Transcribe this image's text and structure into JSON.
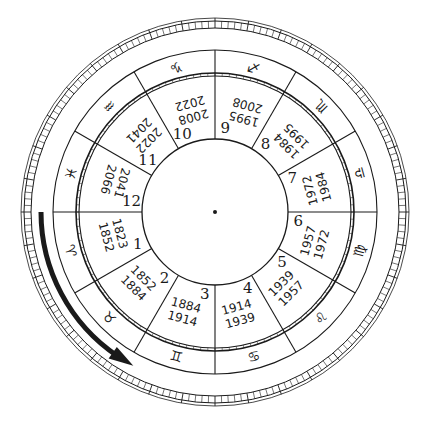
{
  "colors": {
    "ink": "#1a1a1a",
    "background": "#ffffff"
  },
  "center": {
    "x": 215,
    "y": 212
  },
  "radii": {
    "inner_circle": 73,
    "house_ring_inner": 136,
    "house_ring_outer": 139,
    "sign_ring_outer": 162,
    "arrow": 174,
    "tick_ring_inner": 184,
    "tick_ring_outer": 191,
    "outermost": 194
  },
  "houses": [
    {
      "number": "1",
      "from": "1823",
      "to": "1852",
      "sign": "aries",
      "glyph": "♈"
    },
    {
      "number": "2",
      "from": "1852",
      "to": "1884",
      "sign": "taurus",
      "glyph": "♉"
    },
    {
      "number": "3",
      "from": "1884",
      "to": "1914",
      "sign": "gemini",
      "glyph": "♊"
    },
    {
      "number": "4",
      "from": "1914",
      "to": "1939",
      "sign": "cancer",
      "glyph": "♋"
    },
    {
      "number": "5",
      "from": "1939",
      "to": "1957",
      "sign": "leo",
      "glyph": "♌"
    },
    {
      "number": "6",
      "from": "1957",
      "to": "1972",
      "sign": "virgo",
      "glyph": "♍"
    },
    {
      "number": "7",
      "from": "1972",
      "to": "1984",
      "sign": "libra",
      "glyph": "♎"
    },
    {
      "number": "8",
      "from": "1984",
      "to": "1995",
      "sign": "scorpio",
      "glyph": "♏"
    },
    {
      "number": "9",
      "from": "1995",
      "to": "2008",
      "sign": "sagittarius",
      "glyph": "♐"
    },
    {
      "number": "10",
      "from": "2008",
      "to": "2022",
      "sign": "capricorn",
      "glyph": "♑"
    },
    {
      "number": "11",
      "from": "2022",
      "to": "2041",
      "sign": "aquarius",
      "glyph": "♒"
    },
    {
      "number": "12",
      "from": "2041",
      "to": "2066",
      "sign": "pisces",
      "glyph": "♓"
    }
  ],
  "separator": "–",
  "arrow": {
    "direction": "counter-clockwise",
    "start_angle": 180,
    "end_angle": 240,
    "icon": "curved-arrow-icon"
  }
}
